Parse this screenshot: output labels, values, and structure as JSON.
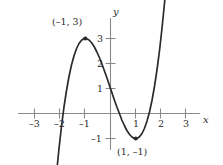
{
  "figure": {
    "background_color": "#ffffff",
    "curve_color": "#2b2b2b",
    "axis_color": "#8a8a8a",
    "text_color": "#2b2b2b"
  },
  "axes": {
    "x_name": "x",
    "y_name": "y",
    "x_ticks": [
      {
        "value": -3,
        "label": "–3"
      },
      {
        "value": -2,
        "label": "–2"
      },
      {
        "value": -1,
        "label": "–1"
      },
      {
        "value": 1,
        "label": "1"
      },
      {
        "value": 2,
        "label": "2"
      },
      {
        "value": 3,
        "label": "3"
      }
    ],
    "y_ticks": [
      {
        "value": 3,
        "label": "3"
      },
      {
        "value": 2,
        "label": "2"
      },
      {
        "value": 1,
        "label": "1"
      },
      {
        "value": -1,
        "label": "–1"
      }
    ]
  },
  "annotations": [
    {
      "name": "local-maximum-label",
      "text": "(–1, 3)",
      "x": -1,
      "y": 3
    },
    {
      "name": "local-minimum-label",
      "text": "(1, –1)",
      "x": 1,
      "y": -1
    }
  ],
  "chart_data": {
    "type": "line",
    "title": "",
    "xlabel": "x",
    "ylabel": "y",
    "xlim": [
      -2.6,
      3.6
    ],
    "ylim": [
      -2.0,
      4.0
    ],
    "grid": false,
    "legend": "none",
    "equation": "y = x^3 - 3x + 1",
    "x_ticks": [
      -3,
      -2,
      -1,
      1,
      2,
      3
    ],
    "y_ticks": [
      3,
      2,
      1,
      -1
    ],
    "domain_drawn": [
      -2.45,
      2.55
    ],
    "markers": [
      {
        "label": "(–1, 3)",
        "x": -1,
        "y": 3,
        "style": "filled-dot"
      },
      {
        "label": "(1, –1)",
        "x": 1,
        "y": -1,
        "style": "filled-dot"
      }
    ],
    "series": [
      {
        "name": "y = x^3 - 3x + 1",
        "x": [
          -2.45,
          -2.35,
          -2.25,
          -2.15,
          -2.05,
          -1.95,
          -1.85,
          -1.75,
          -1.65,
          -1.55,
          -1.45,
          -1.35,
          -1.25,
          -1.15,
          -1.05,
          -1.0,
          -0.95,
          -0.85,
          -0.75,
          -0.65,
          -0.55,
          -0.45,
          -0.35,
          -0.25,
          -0.15,
          -0.05,
          0.0,
          0.05,
          0.15,
          0.25,
          0.35,
          0.45,
          0.55,
          0.65,
          0.75,
          0.85,
          0.95,
          1.0,
          1.05,
          1.15,
          1.25,
          1.35,
          1.45,
          1.55,
          1.65,
          1.75,
          1.85,
          1.95,
          2.05,
          2.15,
          2.25,
          2.35,
          2.45,
          2.55
        ],
        "y": [
          -6.35,
          -4.92,
          -3.64,
          -2.49,
          -1.46,
          -0.56,
          0.23,
          0.89,
          1.46,
          1.93,
          2.3,
          2.59,
          2.8,
          2.93,
          3.0,
          3.0,
          2.99,
          2.94,
          2.83,
          2.68,
          2.48,
          2.26,
          2.01,
          1.73,
          1.45,
          1.15,
          1.0,
          0.85,
          0.55,
          0.27,
          0.01,
          -0.26,
          -0.48,
          -0.68,
          -0.83,
          -0.94,
          -1.0,
          -1.0,
          -1.0,
          -0.93,
          -0.8,
          -0.59,
          -0.3,
          0.07,
          0.54,
          1.11,
          1.78,
          2.56,
          3.47,
          4.49,
          5.64,
          6.93,
          8.35,
          9.93
        ]
      }
    ]
  }
}
